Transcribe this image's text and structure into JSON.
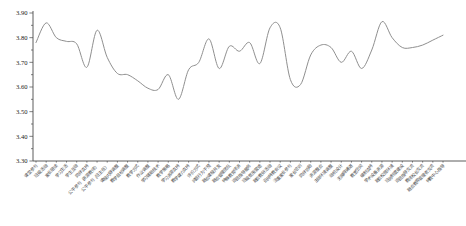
{
  "chart_data": {
    "type": "line",
    "title": "",
    "xlabel": "",
    "ylabel": "",
    "ylim": [
      3.3,
      3.9
    ],
    "ytick_step": 0.1,
    "ytick_labels": [
      "3.30",
      "3.40",
      "3.50",
      "3.60",
      "3.70",
      "3.80",
      "3.90"
    ],
    "minor_tick_step": 0.05,
    "grid": false,
    "legend": null,
    "line_color": "#8f8f8f",
    "axis_color": "#4a4a4a",
    "text_color": "#222222",
    "categories": [
      "课堂参与",
      "班级活动",
      "家长陪读",
      "学习生活",
      "学生互动",
      "同伴支持",
      "公平参与（资源教师）",
      "公平参与（班主任）",
      "课程内容调整",
      "教学目标调整",
      "教学方式",
      "作业调整",
      "学习辅助技术",
      "教学策略",
      "学习资源支持",
      "教学媒介支持",
      "评价方式",
      "问题行为干预",
      "融合课程开发",
      "融合管理团队",
      "特殊教育师资",
      "巡回指导服务",
      "班级氛围营造",
      "融合教研活动",
      "召开特教会议",
      "注重家长参与",
      "家长培训",
      "同伴协助",
      "资源整合",
      "主动环境调整",
      "动机设计",
      "无障碍通道",
      "教室空间",
      "编制支持",
      "学术设备资源",
      "融合校园环境",
      "班务制度建设",
      "巡回指导交流",
      "教师校长交流",
      "融合教育管理者交流",
      "特教中心指导"
    ],
    "values": [
      3.78,
      3.86,
      3.8,
      3.785,
      3.775,
      3.68,
      3.83,
      3.72,
      3.655,
      3.65,
      3.625,
      3.595,
      3.59,
      3.65,
      3.55,
      3.67,
      3.7,
      3.795,
      3.675,
      3.765,
      3.745,
      3.78,
      3.695,
      3.84,
      3.84,
      3.63,
      3.61,
      3.73,
      3.77,
      3.76,
      3.7,
      3.745,
      3.675,
      3.75,
      3.865,
      3.8,
      3.76,
      3.76,
      3.77,
      3.79,
      3.81
    ]
  }
}
